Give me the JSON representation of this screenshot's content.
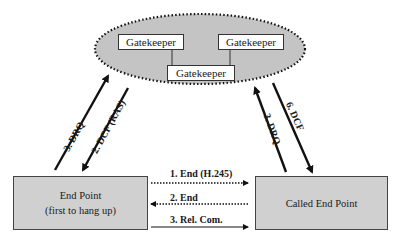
{
  "gatekeeper_cluster": {
    "gatekeepers": [
      {
        "label": "Gatekeeper"
      },
      {
        "label": "Gatekeeper"
      },
      {
        "label": "Gatekeeper"
      }
    ]
  },
  "endpoints": {
    "caller": {
      "line1": "End Point",
      "line2": "(first to hang up)"
    },
    "called": {
      "line1": "Called End Point"
    }
  },
  "messages": {
    "left_up": "3. DRQ",
    "left_down": "2. DCF (RAS)",
    "right_up": "3. DRQ",
    "right_down": "6. DCF",
    "h1": "1. End (H.245)",
    "h2": "2. End",
    "h3": "3. Rel.  Com."
  },
  "colors": {
    "cloud_fill": "#c4c4c4",
    "endpoint_fill": "#d0d0d0"
  }
}
